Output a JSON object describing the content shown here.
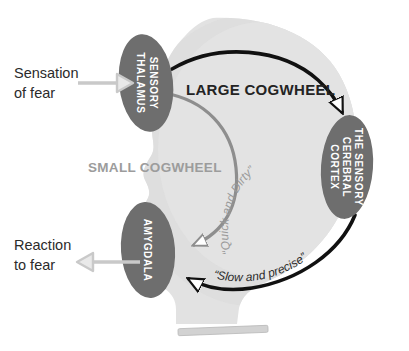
{
  "diagram": {
    "colors": {
      "head_fill": "#e2e2e2",
      "head_fill_dark": "#d6d6d6",
      "region_fill": "#6e6e6e",
      "region_text": "#ffffff",
      "large_pathway": "#111111",
      "small_pathway": "#8e8e8e",
      "connector": "#c9c9c9",
      "side_label_text": "#2b2b2b",
      "base_bar": "#cfcfcf"
    },
    "side_labels": [
      {
        "id": "sensation-of-fear",
        "line1": "Sensation",
        "line2": "of fear",
        "arrow_direction": "right",
        "points_to": "sensory-thalamus"
      },
      {
        "id": "reaction-to-fear",
        "line1": "Reaction",
        "line2": "to fear",
        "arrow_direction": "left",
        "points_from": "amygdala"
      }
    ],
    "regions": [
      {
        "id": "sensory-thalamus",
        "lines": [
          "SENSORY",
          "THALAMUS"
        ],
        "orientation": "vertical-clockwise"
      },
      {
        "id": "amygdala",
        "lines": [
          "AMYGDALA"
        ],
        "orientation": "vertical-clockwise"
      },
      {
        "id": "sensory-cerebral-cortex",
        "lines": [
          "THE SENSORY",
          "CEREBRAL",
          "CORTEX"
        ],
        "orientation": "vertical-clockwise"
      }
    ],
    "pathways": [
      {
        "id": "large-cogwheel",
        "label": "LARGE COGWHEEL",
        "quote": "“Slow and precise”",
        "color": "#111111",
        "route": "thalamus → cortex → amygdala"
      },
      {
        "id": "small-cogwheel",
        "label": "SMALL COGWHEEL",
        "quote": "“Quick and Dirty”",
        "color": "#8e8e8e",
        "route": "thalamus → amygdala"
      }
    ]
  }
}
